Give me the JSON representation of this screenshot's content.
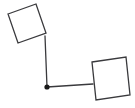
{
  "canvas": {
    "width": 135,
    "height": 108,
    "background_color": "#ffffff"
  },
  "diagram": {
    "type": "node-link-diagram",
    "title": "",
    "stroke_color": "#3a3a3d",
    "node_fill_color": "#ffffff",
    "joint_color": "#1a1a1a",
    "stroke_width": 1.3,
    "nodes": [
      {
        "name": "square-top-left",
        "shape": "square",
        "label": "",
        "fill": "#ffffff",
        "stroke": "#3a3a3d",
        "rotation_deg": -20,
        "points": "8,14 36,4 46,33 18,43",
        "center_x": 27,
        "center_y": 23.5,
        "side_length": 29.8
      },
      {
        "name": "square-bottom-right",
        "shape": "square",
        "label": "",
        "fill": "#ffffff",
        "stroke": "#3a3a3d",
        "rotation_deg": -9,
        "points": "92,62 126,57 130,95 96,100",
        "center_x": 111,
        "center_y": 78.5,
        "side_length": 34.4
      }
    ],
    "joints": [
      {
        "name": "joint-center",
        "shape": "dot",
        "x": 47,
        "y": 87,
        "radius": 2.6,
        "fill": "#1a1a1a"
      }
    ],
    "edges": [
      {
        "name": "edge-top-left-square-to-joint",
        "from": "square-top-left",
        "to": "joint-center",
        "x1": 45,
        "y1": 36,
        "x2": 47,
        "y2": 87,
        "stroke": "#3a3a3d"
      },
      {
        "name": "edge-joint-to-bottom-right-square",
        "from": "joint-center",
        "to": "square-bottom-right",
        "x1": 47,
        "y1": 87,
        "x2": 93,
        "y2": 84,
        "stroke": "#3a3a3d"
      }
    ]
  }
}
